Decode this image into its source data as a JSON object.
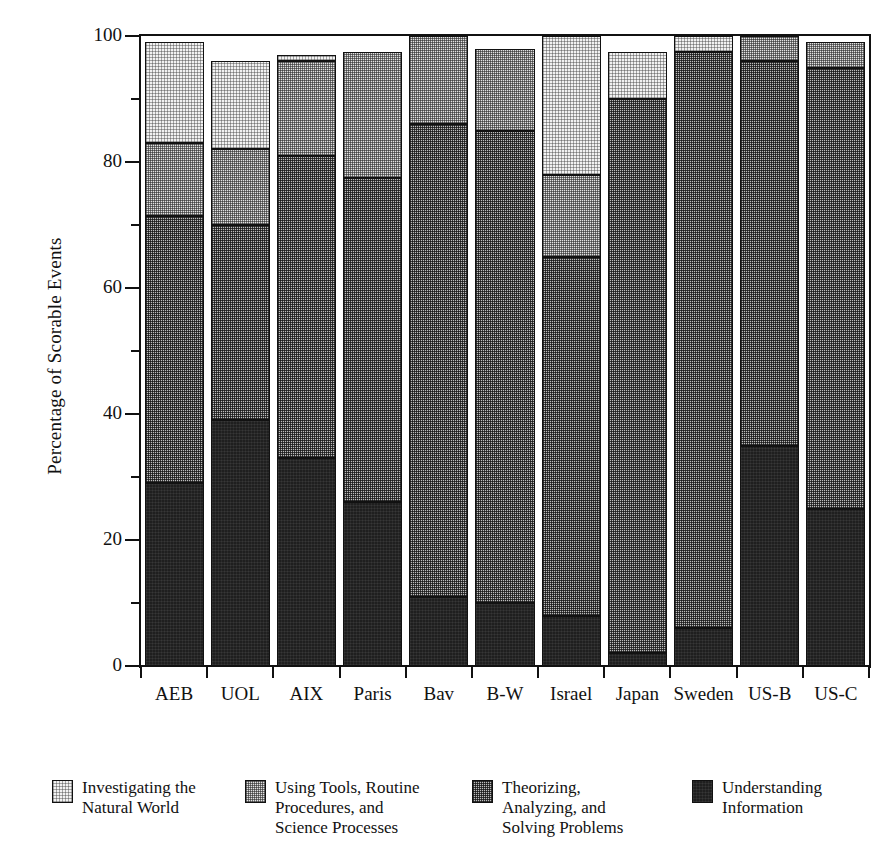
{
  "chart_data": {
    "type": "bar",
    "subtype": "stacked-bar",
    "title": "",
    "xlabel": "",
    "ylabel": "Percentage of Scorable Events",
    "ylim": [
      0,
      100
    ],
    "ytick_labels": [
      "0",
      "20",
      "40",
      "60",
      "80",
      "100"
    ],
    "ytick_values": [
      0,
      20,
      40,
      60,
      80,
      100
    ],
    "yminor_ticks": [
      10,
      30,
      50,
      70,
      90
    ],
    "grid": false,
    "legend_position": "below",
    "categories": [
      "AEB",
      "UOL",
      "AIX",
      "Paris",
      "Bav",
      "B-W",
      "Israel",
      "Japan",
      "Sweden",
      "US-B",
      "US-C"
    ],
    "series": [
      {
        "name": "Understanding Information",
        "legend_label": "Understanding\nInformation",
        "fill": "understanding",
        "color": "#1f1f1f",
        "values": [
          29,
          39,
          33,
          26,
          11,
          10,
          8,
          2,
          6,
          35,
          25
        ]
      },
      {
        "name": "Theorizing, Analyzing, and Solving Problems",
        "legend_label": "Theorizing,\nAnalyzing, and\nSolving Problems",
        "fill": "theorizing",
        "color": "#bdbdbd",
        "values": [
          42.5,
          31,
          48,
          51.5,
          75,
          75,
          57,
          88,
          91.5,
          61,
          70
        ]
      },
      {
        "name": "Using Tools, Routine Procedures, and Science Processes",
        "legend_label": "Using Tools, Routine\nProcedures, and\nScience Processes",
        "fill": "tools",
        "color": "#e2e2e2",
        "values": [
          11.5,
          12,
          15,
          20,
          14,
          13,
          13,
          0,
          0,
          4,
          4
        ]
      },
      {
        "name": "Investigating the Natural World",
        "legend_label": "Investigating the\nNatural World",
        "fill": "investigating",
        "color": "#f2f2f2",
        "values": [
          16,
          14,
          1,
          0,
          0,
          0,
          22,
          7.5,
          2.5,
          0,
          0
        ]
      }
    ],
    "bar_totals": [
      99,
      96,
      97,
      97.5,
      100,
      98,
      100,
      97.5,
      100,
      100,
      99
    ]
  },
  "legend": {
    "items": [
      {
        "label": "Investigating the\nNatural World",
        "swatch": "investigating"
      },
      {
        "label": "Using Tools, Routine\nProcedures, and\nScience Processes",
        "swatch": "tools"
      },
      {
        "label": "Theorizing,\nAnalyzing, and\nSolving Problems",
        "swatch": "theorizing"
      },
      {
        "label": "Understanding\nInformation",
        "swatch": "understanding"
      }
    ],
    "positions": [
      0,
      193,
      420,
      640
    ]
  }
}
